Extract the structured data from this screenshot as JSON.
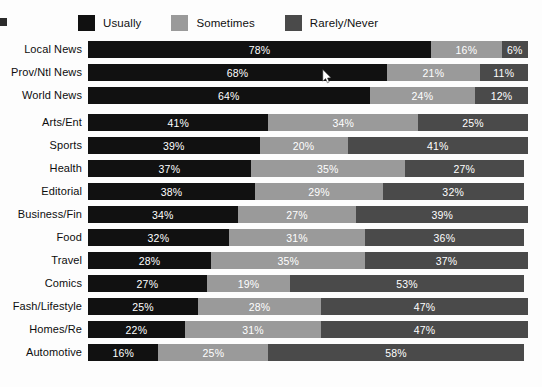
{
  "chart_data": {
    "type": "bar",
    "orientation": "horizontal",
    "stacked": true,
    "stacked_percent": true,
    "title": "",
    "subtitle": "",
    "xlabel": "",
    "ylabel": "",
    "xlim": [
      0,
      100
    ],
    "grid": false,
    "legend_position": "top",
    "value_suffix": "%",
    "categories": [
      "Local News",
      "Prov/Ntl News",
      "World News",
      "Arts/Ent",
      "Sports",
      "Health",
      "Editorial",
      "Business/Fin",
      "Food",
      "Travel",
      "Comics",
      "Fash/Lifestyle",
      "Homes/Re",
      "Automotive"
    ],
    "series": [
      {
        "name": "Usually",
        "color": "#111111",
        "values": [
          78,
          68,
          64,
          41,
          39,
          37,
          38,
          34,
          32,
          28,
          27,
          25,
          22,
          16
        ],
        "labels": [
          "78%",
          "68%",
          "64%",
          "41%",
          "39%",
          "37%",
          "38%",
          "34%",
          "32%",
          "28%",
          "27%",
          "25%",
          "22%",
          "16%"
        ]
      },
      {
        "name": "Sometimes",
        "color": "#9a9a9a",
        "values": [
          16,
          21,
          24,
          34,
          20,
          35,
          29,
          27,
          31,
          35,
          19,
          28,
          31,
          25
        ],
        "labels": [
          "16%",
          "21%",
          "24%",
          "34%",
          "20%",
          "35%",
          "29%",
          "27%",
          "31%",
          "35%",
          "19%",
          "28%",
          "31%",
          "25%"
        ]
      },
      {
        "name": "Rarely/Never",
        "color": "#4a4a4a",
        "values": [
          6,
          11,
          12,
          25,
          41,
          27,
          32,
          39,
          36,
          37,
          53,
          47,
          47,
          58
        ],
        "labels": [
          "6%",
          "11%",
          "12%",
          "25%",
          "41%",
          "27%",
          "32%",
          "39%",
          "36%",
          "37%",
          "53%",
          "47%",
          "47%",
          "58%"
        ]
      }
    ]
  },
  "legend": {
    "items": [
      {
        "label": "Usually",
        "color": "#111111"
      },
      {
        "label": "Sometimes",
        "color": "#9a9a9a"
      },
      {
        "label": "Rarely/Never",
        "color": "#4a4a4a"
      }
    ]
  },
  "cursor": {
    "present": true,
    "x": 322,
    "y": 69
  }
}
